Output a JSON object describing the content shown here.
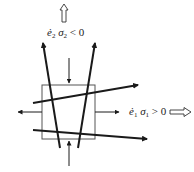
{
  "diagram": {
    "type": "stress-strain schematic",
    "top_label": {
      "strain_rate": "ė",
      "strain_index": "2",
      "stress": "σ",
      "stress_index": "2",
      "relation": "< 0"
    },
    "right_label": {
      "strain_rate": "ė",
      "strain_index": "1",
      "stress": "σ",
      "stress_index": "1",
      "relation": "> 0"
    },
    "arrows": {
      "top_hollow_arrow": "up",
      "right_hollow_arrow": "right",
      "top_load_arrow": "down (compressive)",
      "bottom_load_arrow": "up (compressive)",
      "left_load_arrow": "left (tensile)",
      "right_load_arrow": "right (tensile)"
    },
    "colors": {
      "stroke": "#1a1a1a",
      "box": "#555555",
      "background": "#ffffff"
    }
  }
}
